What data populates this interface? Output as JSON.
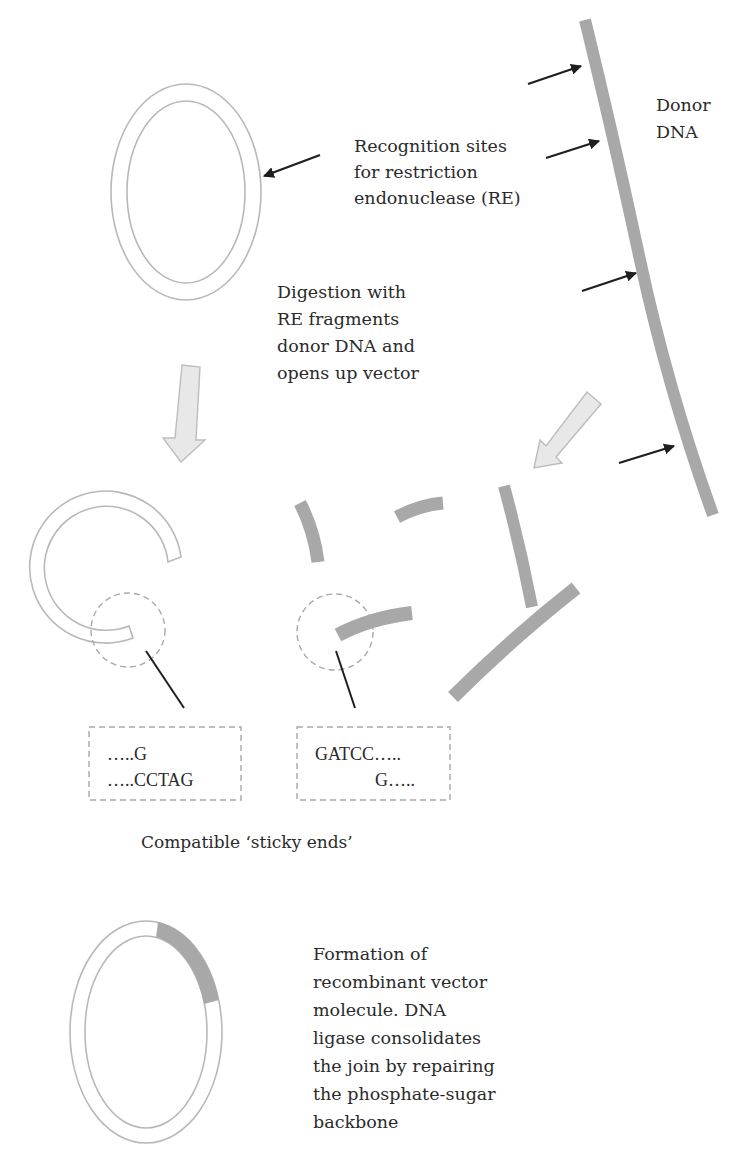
{
  "diagram": {
    "type": "recombinant-dna-cloning-flow",
    "colors": {
      "dna_strand": "#a8a8a8",
      "ring_outline": "#b8b8b8",
      "flow_arrow_fill": "#e8e8e8",
      "pointer": "#1e1e1e",
      "text": "#2a2a2a"
    },
    "labels": {
      "donor_dna": [
        "Donor",
        "DNA"
      ],
      "recognition_sites": [
        "Recognition sites",
        "for restriction",
        "endonuclease (RE)"
      ],
      "digestion": [
        "Digestion with",
        "RE  fragments",
        "donor DNA and",
        "opens up vector"
      ],
      "sticky_caption": "Compatible ‘sticky ends’",
      "formation": [
        "Formation of",
        "recombinant vector",
        "molecule. DNA",
        "ligase consolidates",
        "the join by repairing",
        "the phosphate-sugar",
        "backbone"
      ]
    },
    "sticky_ends": {
      "vector_end": [
        "…..G",
        "…..CCTAG"
      ],
      "insert_end": [
        "GATCC…..",
        "G….."
      ]
    },
    "nodes": [
      {
        "id": "vector-plasmid",
        "label": "circular vector"
      },
      {
        "id": "donor-dna",
        "label": "Donor DNA"
      },
      {
        "id": "opened-vector",
        "label": "linearized vector"
      },
      {
        "id": "donor-fragments",
        "count": 5
      },
      {
        "id": "recombinant-plasmid",
        "label": "recombinant vector molecule"
      }
    ],
    "edges": [
      {
        "from": "vector-plasmid",
        "to": "opened-vector",
        "via": "digestion"
      },
      {
        "from": "donor-dna",
        "to": "donor-fragments",
        "via": "digestion"
      },
      {
        "from": "opened-vector",
        "to": "recombinant-plasmid",
        "via": "ligation"
      },
      {
        "from": "donor-fragments",
        "to": "recombinant-plasmid",
        "via": "ligation"
      }
    ]
  }
}
